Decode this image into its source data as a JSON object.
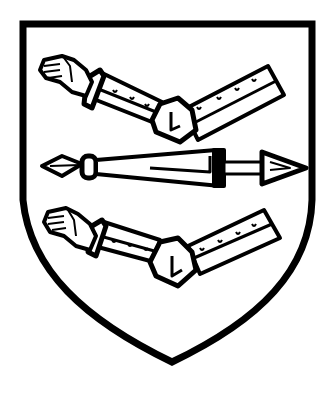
{
  "image": {
    "title": "Heraldic shield",
    "description": "Black-and-white line drawing of a heater shield bearing two armoured arms (vambraced, hands open) with a dart/spear between them"
  },
  "shield": {
    "stroke_color": "#000000",
    "fill_color": "#ffffff",
    "charges": [
      {
        "name": "upper arm",
        "type": "armoured arm embowed, hand open to the left"
      },
      {
        "name": "spear",
        "type": "dart / spear fesswise, point to the right"
      },
      {
        "name": "lower arm",
        "type": "armoured arm embowed, hand open to the left"
      }
    ]
  }
}
